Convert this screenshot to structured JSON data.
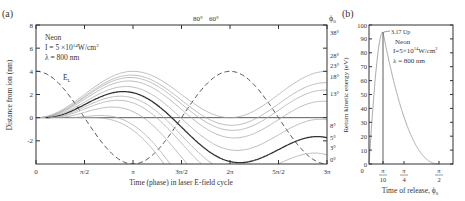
{
  "chart_data": [
    {
      "panel": "(a)",
      "type": "line",
      "xlabel": "Time (phase) in laser E-field cycle",
      "ylabel": "Distance from ion (nm)",
      "xlim": [
        0,
        9.4248
      ],
      "ylim": [
        -4,
        8
      ],
      "xticks": [
        "0",
        "π/2",
        "π",
        "3π/2",
        "2π",
        "5π/2",
        "3π"
      ],
      "yticks": [
        "-2",
        "0",
        "2",
        "4",
        "6",
        "8"
      ],
      "annotation": {
        "lines": [
          "Neon",
          "I = 5 ×10¹⁴W/cm²",
          "λ = 800 nm"
        ]
      },
      "field_label": "E_L",
      "right_label": "φ0",
      "top_labels": [
        "80°",
        "60°"
      ],
      "phase_labels": [
        "38°",
        "28°",
        "23°",
        "18°",
        "13°",
        "8°",
        "5°",
        "3°",
        "0°"
      ],
      "highlighted_phase": "18°"
    },
    {
      "panel": "(b)",
      "type": "line",
      "xlabel": "Time of release, φ0",
      "ylabel": "Return kinetic energy (eV)",
      "ylim": [
        0,
        100
      ],
      "yticks": [
        "0",
        "10",
        "20",
        "30",
        "40",
        "50",
        "60",
        "70",
        "80",
        "90",
        "100"
      ],
      "xticks": [
        "0",
        "π/10",
        "π/4",
        "π/2"
      ],
      "peak_label": "3.17 Up",
      "peak_value_eV": 95,
      "peak_phase": "π/10",
      "annotation": {
        "lines": [
          "Neon",
          "I=5×10¹⁴W/cm²",
          "λ = 800 nm"
        ]
      }
    }
  ],
  "labels": {
    "panel_a": "(a)",
    "panel_b": "(b)",
    "a_title1": "Neon",
    "a_title2": "I = 5 ×10",
    "a_title2_exp": "14",
    "a_title2_unit": "W/cm",
    "a_title3": "λ = 800 nm",
    "b_title1": "Neon",
    "b_title2": "I=5×10",
    "b_title2_exp": "14",
    "b_title2_unit": "W/cm",
    "b_title3": "λ = 800 nm",
    "peak": "3.17 Up",
    "el": "E",
    "el_sub": "L",
    "phi0": "ϕ",
    "phi0_sub": "0",
    "top1": "80°",
    "top2": "60°",
    "xlabel_a": "Time (phase) in laser E-field cycle",
    "ylabel_a": "Distance from ion (nm)",
    "xlabel_b": "Time of release, ϕ",
    "xlabel_b_sub": "0",
    "ylabel_b": "Return kinetic energy (eV)"
  }
}
